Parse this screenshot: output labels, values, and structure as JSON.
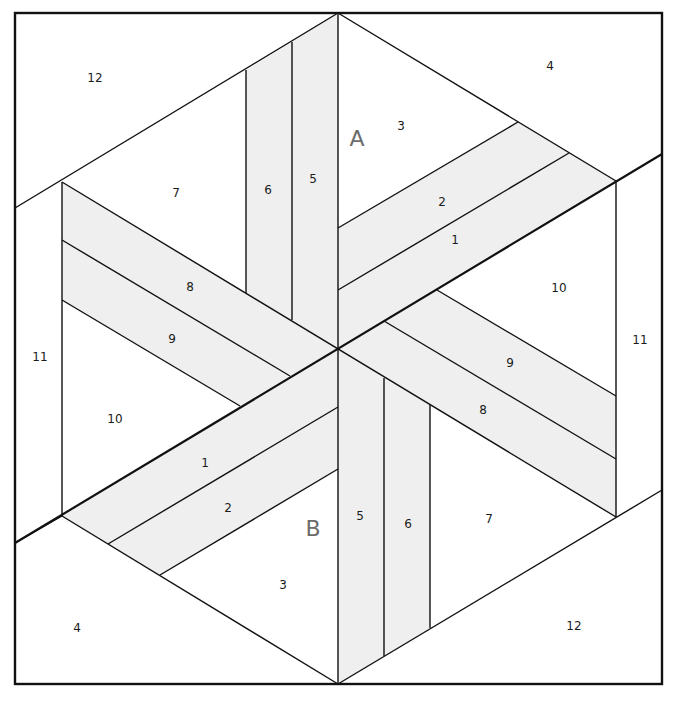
{
  "diagram": {
    "type": "quilt-block-foundation-pattern",
    "colors": {
      "strip_fill": "#efefef",
      "line": "#111111",
      "section_label": "#6b6b6b",
      "background": "#ffffff"
    },
    "section_labels": [
      {
        "id": "A",
        "text": "A",
        "x": 357,
        "y": 140
      },
      {
        "id": "B",
        "text": "B",
        "x": 313,
        "y": 530
      }
    ],
    "piece_labels": [
      {
        "text": "12",
        "x": 95,
        "y": 78,
        "section": "A"
      },
      {
        "text": "4",
        "x": 550,
        "y": 66,
        "section": "A"
      },
      {
        "text": "3",
        "x": 401,
        "y": 126,
        "section": "A"
      },
      {
        "text": "7",
        "x": 176,
        "y": 193,
        "section": "A"
      },
      {
        "text": "6",
        "x": 268,
        "y": 190,
        "section": "A"
      },
      {
        "text": "5",
        "x": 313,
        "y": 179,
        "section": "A"
      },
      {
        "text": "2",
        "x": 442,
        "y": 202,
        "section": "A"
      },
      {
        "text": "1",
        "x": 455,
        "y": 240,
        "section": "A"
      },
      {
        "text": "10",
        "x": 559,
        "y": 288,
        "section": "A"
      },
      {
        "text": "11",
        "x": 640,
        "y": 340,
        "section": "A"
      },
      {
        "text": "8",
        "x": 190,
        "y": 287,
        "section": "A"
      },
      {
        "text": "9",
        "x": 172,
        "y": 339,
        "section": "A"
      },
      {
        "text": "9",
        "x": 510,
        "y": 363,
        "section": "B"
      },
      {
        "text": "8",
        "x": 483,
        "y": 410,
        "section": "B"
      },
      {
        "text": "11",
        "x": 40,
        "y": 357,
        "section": "B"
      },
      {
        "text": "10",
        "x": 115,
        "y": 419,
        "section": "B"
      },
      {
        "text": "1",
        "x": 205,
        "y": 463,
        "section": "B"
      },
      {
        "text": "2",
        "x": 228,
        "y": 508,
        "section": "B"
      },
      {
        "text": "5",
        "x": 360,
        "y": 516,
        "section": "B"
      },
      {
        "text": "6",
        "x": 408,
        "y": 524,
        "section": "B"
      },
      {
        "text": "7",
        "x": 489,
        "y": 519,
        "section": "B"
      },
      {
        "text": "3",
        "x": 283,
        "y": 585,
        "section": "B"
      },
      {
        "text": "4",
        "x": 77,
        "y": 628,
        "section": "B"
      },
      {
        "text": "12",
        "x": 574,
        "y": 626,
        "section": "B"
      }
    ]
  }
}
